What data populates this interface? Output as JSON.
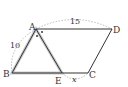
{
  "diagram": {
    "type": "parallelogram-geometry",
    "points": {
      "A": {
        "label": "A",
        "x": 36,
        "y": 29
      },
      "B": {
        "label": "B",
        "x": 12,
        "y": 73
      },
      "C": {
        "label": "C",
        "x": 88,
        "y": 73
      },
      "D": {
        "label": "D",
        "x": 112,
        "y": 29
      },
      "E": {
        "label": "E",
        "x": 62,
        "y": 73
      }
    },
    "measures": {
      "AD": "15",
      "AB": "10",
      "EC": "x"
    },
    "colors": {
      "line": "#333333",
      "highlight": "#bbbbbb",
      "arc": "#aaaaaa"
    }
  }
}
